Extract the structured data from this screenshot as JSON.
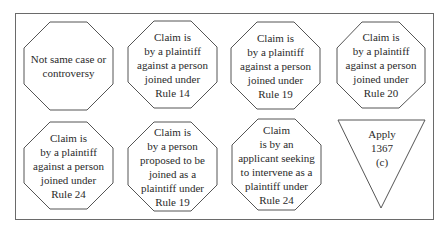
{
  "diagram": {
    "frame": {
      "stroke": "#6a6a6a"
    },
    "shapes": [
      {
        "id": "s1",
        "shape": "octagon",
        "text": "Not same case or\ncontroversy"
      },
      {
        "id": "s2",
        "shape": "octagon",
        "text": "Claim is\nby a plaintiff\nagainst a person\njoined under\nRule 14"
      },
      {
        "id": "s3",
        "shape": "octagon",
        "text": "Claim is\nby a plaintiff\nagainst a person\njoined under\nRule 19"
      },
      {
        "id": "s4",
        "shape": "octagon",
        "text": "Claim is\nby a plaintiff\nagainst a person\njoined under\nRule 20"
      },
      {
        "id": "s5",
        "shape": "octagon",
        "text": "Claim is\nby a plaintiff\nagainst a person\njoined under\nRule 24"
      },
      {
        "id": "s6",
        "shape": "octagon",
        "text": "Claim is\nby a person\nproposed to be\njoined as a\nplaintiff under\nRule 19"
      },
      {
        "id": "s7",
        "shape": "octagon",
        "text": "Claim\nis by an\napplicant seeking\nto intervene as a\nplaintiff under\nRule 24"
      },
      {
        "id": "s8",
        "shape": "inverted-triangle",
        "text": "Apply\n1367\n(c)"
      }
    ]
  }
}
